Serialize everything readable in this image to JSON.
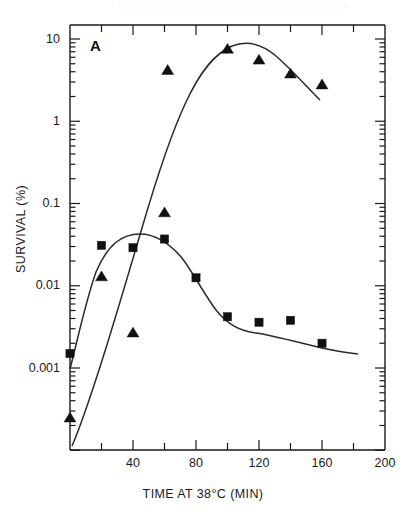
{
  "figure": {
    "panel_letter": "A",
    "background_color": "#ffffff",
    "ink_color": "#1a1a1a"
  },
  "chart_data": {
    "type": "scatter",
    "title": "",
    "subtitle": "",
    "panel_label": "A",
    "xlabel": "TIME AT 38°C (MIN)",
    "ylabel": "SURVIVAL (%)",
    "xscale": "linear",
    "yscale": "log",
    "xlim": [
      0,
      200
    ],
    "ylim": [
      0.0002,
      20
    ],
    "grid": false,
    "legend_position": "none",
    "x_ticks_major": [
      0,
      40,
      80,
      120,
      160,
      200
    ],
    "x_tick_labels": [
      "",
      "40",
      "80",
      "120",
      "160",
      "200"
    ],
    "x_ticks_minor": [
      20,
      60,
      100,
      140,
      180
    ],
    "y_ticks_major": [
      10,
      1,
      0.1,
      0.01,
      0.001
    ],
    "y_tick_labels": [
      "10",
      "1",
      "0.1",
      "0.01",
      "0.001"
    ],
    "series": [
      {
        "name": "triangles",
        "marker": "triangle",
        "marker_color": "#111111",
        "has_fitted_curve": true,
        "points": [
          {
            "x": 0,
            "y": 0.00025
          },
          {
            "x": 20,
            "y": 0.013
          },
          {
            "x": 40,
            "y": 0.0027
          },
          {
            "x": 60,
            "y": 0.078
          },
          {
            "x": 62,
            "y": 4.2
          },
          {
            "x": 100,
            "y": 7.6
          },
          {
            "x": 120,
            "y": 5.6
          },
          {
            "x": 140,
            "y": 3.8
          },
          {
            "x": 160,
            "y": 2.8
          }
        ]
      },
      {
        "name": "squares",
        "marker": "square",
        "marker_color": "#111111",
        "has_fitted_curve": true,
        "points": [
          {
            "x": 0,
            "y": 0.0015
          },
          {
            "x": 20,
            "y": 0.031
          },
          {
            "x": 40,
            "y": 0.029
          },
          {
            "x": 60,
            "y": 0.037
          },
          {
            "x": 80,
            "y": 0.0125
          },
          {
            "x": 100,
            "y": 0.0042
          },
          {
            "x": 120,
            "y": 0.0036
          },
          {
            "x": 140,
            "y": 0.0038
          },
          {
            "x": 160,
            "y": 0.002
          }
        ]
      }
    ]
  }
}
